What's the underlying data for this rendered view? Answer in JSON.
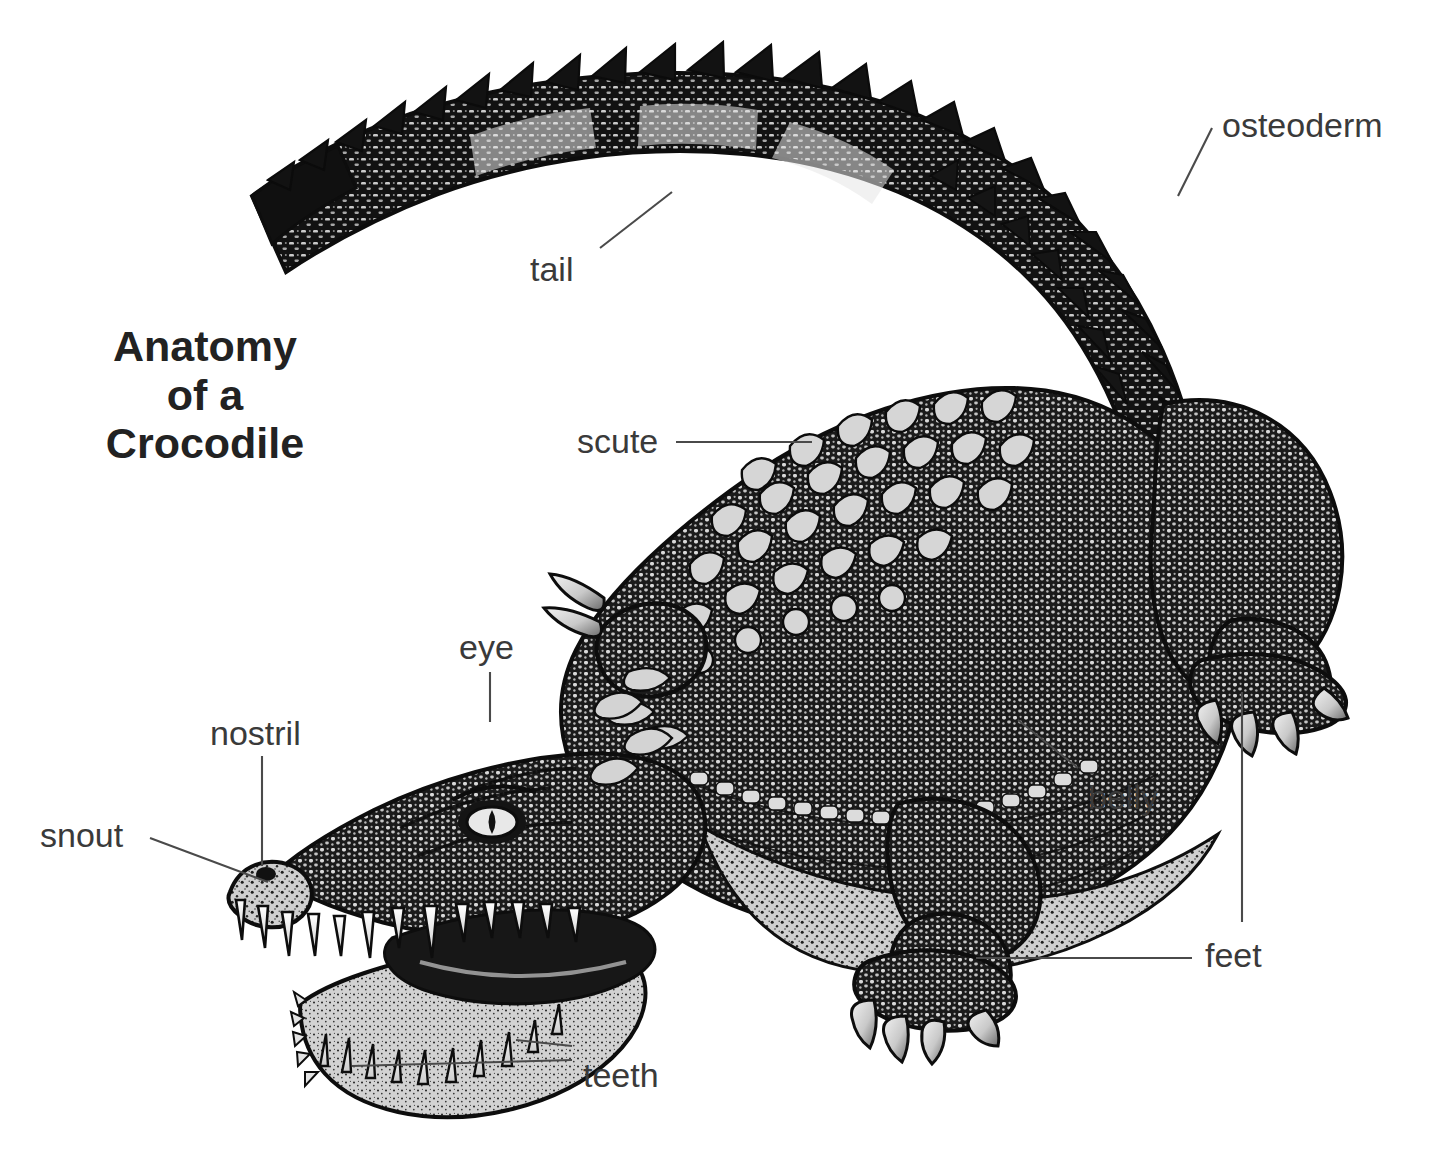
{
  "figure": {
    "kind": "anatomical-illustration",
    "subject": "crocodile",
    "style": "black-and-white stipple line engraving",
    "background_color": "#ffffff",
    "ink_color": "#111111",
    "title_color": "#222222",
    "label_color": "#3a3a3a",
    "leader_color": "#4a4a4a"
  },
  "title": {
    "line1": "Anatomy",
    "line2": "of a",
    "line3": "Crocodile"
  },
  "labels": [
    {
      "key": "osteoderm",
      "text": "osteoderm",
      "x": 1222,
      "y": 108,
      "anchor": "start"
    },
    {
      "key": "tail",
      "text": "tail",
      "x": 530,
      "y": 252,
      "anchor": "start"
    },
    {
      "key": "scute",
      "text": "scute",
      "x": 577,
      "y": 424,
      "anchor": "start"
    },
    {
      "key": "eye",
      "text": "eye",
      "x": 459,
      "y": 630,
      "anchor": "start"
    },
    {
      "key": "nostril",
      "text": "nostril",
      "x": 210,
      "y": 716,
      "anchor": "start"
    },
    {
      "key": "snout",
      "text": "snout",
      "x": 40,
      "y": 818,
      "anchor": "start"
    },
    {
      "key": "belly",
      "text": "belly",
      "x": 1088,
      "y": 780,
      "anchor": "start"
    },
    {
      "key": "feet",
      "text": "feet",
      "x": 1205,
      "y": 938,
      "anchor": "start"
    },
    {
      "key": "teeth",
      "text": "teeth",
      "x": 583,
      "y": 1058,
      "anchor": "start"
    }
  ],
  "leaders": [
    {
      "key": "osteoderm-leader",
      "points": "1212,128 1178,196"
    },
    {
      "key": "tail-leader",
      "points": "600,248 672,192"
    },
    {
      "key": "scute-leader",
      "points": "676,442 812,442"
    },
    {
      "key": "eye-leader",
      "points": "490,672 490,722"
    },
    {
      "key": "nostril-leader",
      "points": "262,756 262,866"
    },
    {
      "key": "snout-leader",
      "points": "150,838 268,882"
    },
    {
      "key": "belly-leader",
      "points": "1078,768 1018,720"
    },
    {
      "key": "feet-leader-hind",
      "points": "1242,922 1242,692"
    },
    {
      "key": "feet-leader-fore",
      "points": "1192,958 976,958"
    },
    {
      "key": "teeth-leader-up",
      "points": "572,1046 516,1040"
    },
    {
      "key": "teeth-leader-low",
      "points": "572,1060 352,1066"
    }
  ]
}
